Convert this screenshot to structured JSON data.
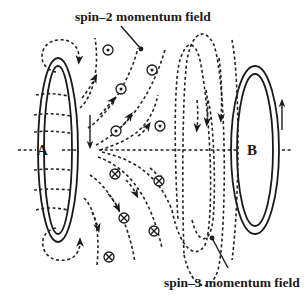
{
  "figure": {
    "labels": {
      "spin2": "spin–2 momentum field",
      "spin3": "spin–3 momentum field",
      "coil_a": "A",
      "coil_b": "B"
    },
    "colors": {
      "ink": "#1a1a1a",
      "background": "#ffffff"
    },
    "symbols": {
      "out_of_page": [
        {
          "x": 108,
          "y": 50
        },
        {
          "x": 121,
          "y": 89
        },
        {
          "x": 152,
          "y": 70
        },
        {
          "x": 118,
          "y": 132
        },
        {
          "x": 161,
          "y": 127
        }
      ],
      "into_page": [
        {
          "x": 115,
          "y": 174
        },
        {
          "x": 160,
          "y": 182
        },
        {
          "x": 124,
          "y": 218
        },
        {
          "x": 154,
          "y": 231
        },
        {
          "x": 109,
          "y": 257
        }
      ]
    },
    "coils": [
      {
        "name": "A",
        "cx": 58,
        "cy": 150,
        "current_direction": "down"
      },
      {
        "name": "B",
        "cx": 255,
        "cy": 150,
        "current_direction": "up"
      }
    ]
  }
}
